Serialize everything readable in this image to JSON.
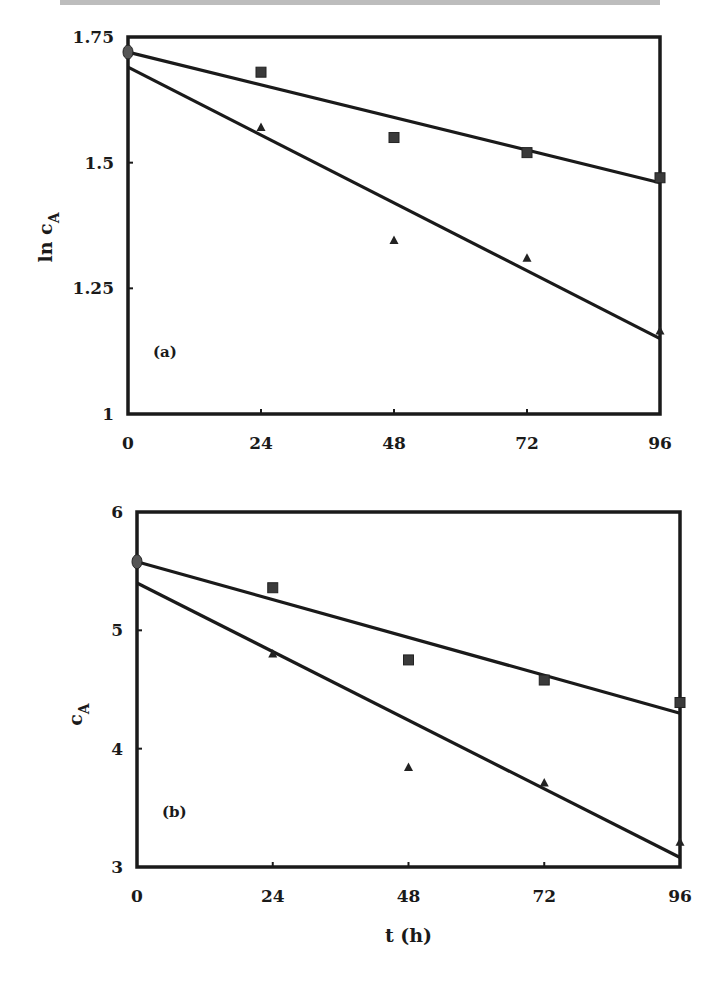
{
  "header_fragment": "",
  "chart_data": [
    {
      "id": "a",
      "type": "scatter",
      "panel_label": "(a)",
      "title": "",
      "xlabel": "",
      "ylabel": "ln c_A",
      "ylabel_main": "ln c",
      "ylabel_sub": "A",
      "xlim": [
        0,
        96
      ],
      "ylim": [
        1,
        1.75
      ],
      "xticks": [
        0,
        24,
        48,
        72,
        96
      ],
      "xtick_labels": [
        "0",
        "24",
        "48",
        "72",
        "96"
      ],
      "yticks": [
        1,
        1.25,
        1.5,
        1.75
      ],
      "ytick_labels": [
        "1",
        "1.25",
        "1.5",
        "1.75"
      ],
      "grid": false,
      "legend": "none",
      "series": [
        {
          "name": "squares",
          "marker": "square",
          "x": [
            0,
            24,
            48,
            72,
            96
          ],
          "y": [
            1.72,
            1.68,
            1.55,
            1.52,
            1.47
          ],
          "fit": {
            "x": [
              0,
              96
            ],
            "y": [
              1.72,
              1.46
            ]
          }
        },
        {
          "name": "triangles",
          "marker": "triangle",
          "x": [
            0,
            24,
            48,
            72,
            96
          ],
          "y": [
            1.72,
            1.57,
            1.345,
            1.31,
            1.165
          ],
          "fit": {
            "x": [
              0,
              96
            ],
            "y": [
              1.69,
              1.15
            ]
          }
        }
      ]
    },
    {
      "id": "b",
      "type": "scatter",
      "panel_label": "(b)",
      "title": "",
      "xlabel": "t (h)",
      "ylabel": "c_A",
      "ylabel_main": "c",
      "ylabel_sub": "A",
      "xlim": [
        0,
        96
      ],
      "ylim": [
        3,
        6
      ],
      "xticks": [
        0,
        24,
        48,
        72,
        96
      ],
      "xtick_labels": [
        "0",
        "24",
        "48",
        "72",
        "96"
      ],
      "yticks": [
        3,
        4,
        5,
        6
      ],
      "ytick_labels": [
        "3",
        "4",
        "5",
        "6"
      ],
      "grid": false,
      "legend": "none",
      "series": [
        {
          "name": "squares",
          "marker": "square",
          "x": [
            0,
            24,
            48,
            72,
            96
          ],
          "y": [
            5.58,
            5.36,
            4.75,
            4.58,
            4.39
          ],
          "fit": {
            "x": [
              0,
              96
            ],
            "y": [
              5.58,
              4.3
            ]
          }
        },
        {
          "name": "triangles",
          "marker": "triangle",
          "x": [
            0,
            24,
            48,
            72,
            96
          ],
          "y": [
            5.58,
            4.8,
            3.84,
            3.71,
            3.21
          ],
          "fit": {
            "x": [
              0,
              96
            ],
            "y": [
              5.4,
              3.08
            ]
          }
        }
      ]
    }
  ],
  "layout": {
    "panels": [
      {
        "x0": 128,
        "x1": 660,
        "y_top": 37,
        "y_bottom": 414
      },
      {
        "x0": 137,
        "x1": 680,
        "y_top": 512,
        "y_bottom": 867
      }
    ]
  }
}
